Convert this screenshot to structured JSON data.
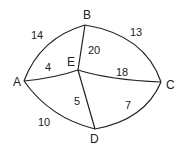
{
  "diagram": {
    "type": "weighted-undirected-graph",
    "nodes": [
      {
        "id": "A",
        "label": "A"
      },
      {
        "id": "B",
        "label": "B"
      },
      {
        "id": "C",
        "label": "C"
      },
      {
        "id": "D",
        "label": "D"
      },
      {
        "id": "E",
        "label": "E"
      }
    ],
    "edges": [
      {
        "from": "A",
        "to": "B",
        "weight": "14"
      },
      {
        "from": "B",
        "to": "C",
        "weight": "13"
      },
      {
        "from": "B",
        "to": "E",
        "weight": "20"
      },
      {
        "from": "A",
        "to": "E",
        "weight": "4"
      },
      {
        "from": "E",
        "to": "C",
        "weight": "18"
      },
      {
        "from": "E",
        "to": "D",
        "weight": "5"
      },
      {
        "from": "A",
        "to": "D",
        "weight": "10"
      },
      {
        "from": "D",
        "to": "C",
        "weight": "7"
      }
    ]
  }
}
